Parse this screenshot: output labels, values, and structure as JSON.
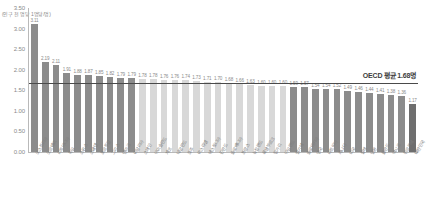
{
  "chart_data": {
    "type": "bar",
    "title": "",
    "xlabel": "",
    "ylabel": "인구 천 명당 임상의사 수",
    "unit_note": "(인구 천 명당 1명당/명)",
    "ylim": [
      0,
      3.5
    ],
    "ytick_step": 0.5,
    "grid": false,
    "legend": null,
    "yticks": [
      "0.00",
      "0.50",
      "1.00",
      "1.50",
      "2.00",
      "2.50",
      "3.00",
      "3.50"
    ],
    "categories": [
      "오스트리아",
      "노르웨이",
      "리투아니아",
      "독일",
      "스위스",
      "스웨덴",
      "포르투갈",
      "그리스",
      "덴마크",
      "이탈리아",
      "스페인",
      "아이슬란드",
      "체코",
      "네덜란드",
      "호주",
      "이스라엘",
      "에스토니아",
      "핀란드",
      "슬로베니아",
      "프랑스",
      "뉴질랜드",
      "룩셈부르크",
      "헝가리",
      "아일랜드",
      "벨기에",
      "슬로바키아",
      "영국",
      "라트비아",
      "캐나다",
      "미국",
      "칠레",
      "일본",
      "폴란드",
      "멕시코",
      "튀르키예",
      "대한민국"
    ],
    "values": [
      3.11,
      2.19,
      2.11,
      1.91,
      1.88,
      1.87,
      1.85,
      1.82,
      1.79,
      1.79,
      1.78,
      1.78,
      1.76,
      1.76,
      1.74,
      1.73,
      1.71,
      1.7,
      1.68,
      1.66,
      1.63,
      1.6,
      1.6,
      1.6,
      1.59,
      1.57,
      1.54,
      1.54,
      1.52,
      1.49,
      1.46,
      1.44,
      1.41,
      1.38,
      1.36,
      1.17
    ],
    "average": {
      "label": "OECD 평균 1.68명",
      "value": 1.68
    },
    "colors": {
      "bar_dark": "#8c8c8c",
      "bar_light": "#d8d8d8",
      "bar_highlight": "#6e6e6e",
      "average_line": "#4a4a4a",
      "axis": "#b9b9b9",
      "text": "#8a8a8a"
    }
  }
}
